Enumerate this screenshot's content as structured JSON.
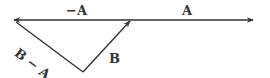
{
  "diagram": {
    "type": "vector-triangle",
    "labels": {
      "neg_a": "−A",
      "a": "A",
      "b": "B",
      "b_minus_a": "B − A"
    },
    "vectors": [
      {
        "name": "A",
        "from": [
          130,
          20
        ],
        "to": [
          253,
          20
        ],
        "direction": "right"
      },
      {
        "name": "-A",
        "from": [
          130,
          20
        ],
        "to": [
          14,
          20
        ],
        "direction": "left"
      },
      {
        "name": "B",
        "from": [
          83,
          72
        ],
        "to": [
          130,
          21
        ],
        "direction": "up-right"
      },
      {
        "name": "B - A",
        "from": [
          83,
          72
        ],
        "to": [
          15,
          21
        ],
        "direction": "up-left"
      }
    ],
    "colors": {
      "stroke": "#333333",
      "background": "#ffffff"
    }
  }
}
